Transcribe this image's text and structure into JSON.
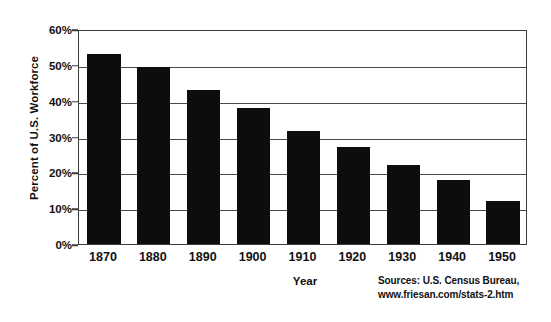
{
  "chart_data": {
    "type": "bar",
    "title": "",
    "subtitle": "",
    "xlabel": "Year",
    "ylabel": "Percent of U.S. Workforce",
    "categories": [
      "1870",
      "1880",
      "1890",
      "1900",
      "1910",
      "1920",
      "1930",
      "1940",
      "1950"
    ],
    "values": [
      53,
      49.5,
      43,
      38,
      31.5,
      27,
      22,
      18,
      12
    ],
    "value_labels": [
      "53%",
      "49.5%",
      "43%",
      "38%",
      "31.5%",
      "27%",
      "22%",
      "18%",
      "12%"
    ],
    "ylim": [
      0,
      60
    ],
    "ytick_values": [
      0,
      10,
      20,
      30,
      40,
      50,
      60
    ],
    "ytick_labels": [
      "0%",
      "10%",
      "20%",
      "30%",
      "40%",
      "50%",
      "60%"
    ],
    "xtick_labels": [
      "1870",
      "1880",
      "1890",
      "1900",
      "1910",
      "1920",
      "1930",
      "1940",
      "1950"
    ],
    "grid": true,
    "grid_axis": "y",
    "legend": false,
    "legend_position": "none",
    "bar_color": "#0d0d0d",
    "axis_color": "#3b3b3b",
    "grid_color": "#4a4a4a",
    "background_color": "#ffffff",
    "annotations": [
      "Sources: U.S. Census Bureau,",
      "www.friesan.com/stats-2.htm"
    ]
  },
  "sources": {
    "line1": "Sources: U.S. Census Bureau,",
    "line2": "www.friesan.com/stats-2.htm"
  }
}
